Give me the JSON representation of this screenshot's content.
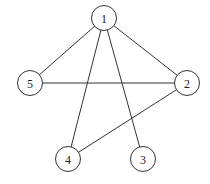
{
  "diagram": {
    "type": "undirected-graph",
    "nodes": [
      {
        "id": "1",
        "label": "1"
      },
      {
        "id": "2",
        "label": "2"
      },
      {
        "id": "3",
        "label": "3"
      },
      {
        "id": "4",
        "label": "4"
      },
      {
        "id": "5",
        "label": "5"
      }
    ],
    "edges": [
      {
        "from": "1",
        "to": "5"
      },
      {
        "from": "1",
        "to": "2"
      },
      {
        "from": "1",
        "to": "4"
      },
      {
        "from": "1",
        "to": "3"
      },
      {
        "from": "5",
        "to": "2"
      },
      {
        "from": "2",
        "to": "4"
      }
    ],
    "colors": {
      "stroke": "#333333",
      "fill": "#ffffff",
      "text": "#222222"
    }
  }
}
